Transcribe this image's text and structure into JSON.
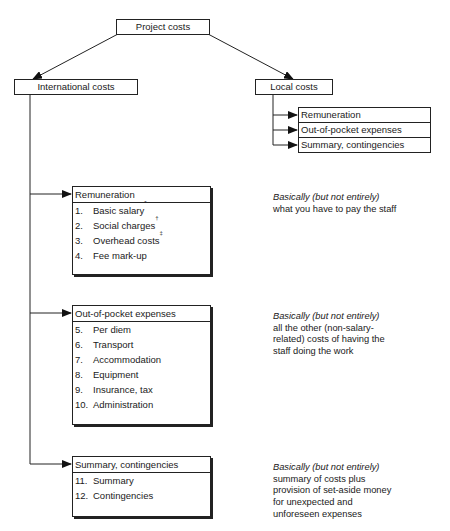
{
  "diagram": {
    "root": {
      "label": "Project costs"
    },
    "international": {
      "label": "International costs"
    },
    "local": {
      "label": "Local costs",
      "children": [
        {
          "label": "Remuneration"
        },
        {
          "label": "Out-of-pocket expenses"
        },
        {
          "label": "Summary, contingencies"
        }
      ]
    },
    "cards": [
      {
        "title": "Remuneration",
        "items": [
          {
            "num": "1.",
            "label": "Basic salary",
            "mark": "*"
          },
          {
            "num": "2.",
            "label": "Social charges",
            "mark": "†"
          },
          {
            "num": "3.",
            "label": "Overhead costs",
            "mark": "‡"
          },
          {
            "num": "4.",
            "label": "Fee mark-up",
            "mark": ""
          }
        ],
        "note_lead": "Basically (but not entirely)",
        "note_text": "what you have to pay the staff"
      },
      {
        "title": "Out-of-pocket expenses",
        "items": [
          {
            "num": "5.",
            "label": "Per diem",
            "mark": ""
          },
          {
            "num": "6.",
            "label": "Transport",
            "mark": ""
          },
          {
            "num": "7.",
            "label": "Accommodation",
            "mark": ""
          },
          {
            "num": "8.",
            "label": "Equipment",
            "mark": ""
          },
          {
            "num": "9.",
            "label": "Insurance, tax",
            "mark": ""
          },
          {
            "num": "10.",
            "label": "Administration",
            "mark": ""
          }
        ],
        "note_lead": "Basically (but not entirely)",
        "note_text": "all the other (non-salary-related) costs of having the staff doing the work"
      },
      {
        "title": "Summary, contingencies",
        "items": [
          {
            "num": "11.",
            "label": "Summary",
            "mark": ""
          },
          {
            "num": "12.",
            "label": "Contingencies",
            "mark": ""
          }
        ],
        "note_lead": "Basically (but not entirely)",
        "note_text": "summary of costs plus provision of set-aside money for unexpected and unforeseen expenses"
      }
    ]
  }
}
